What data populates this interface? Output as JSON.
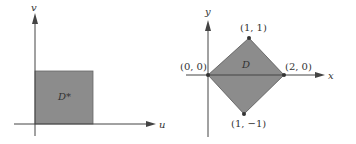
{
  "colors": {
    "background": "#ffffff",
    "axis": "#444444",
    "region_fill": "#8c8c8c",
    "region_stroke": "#555555",
    "text": "#333333",
    "vertex": "#333333"
  },
  "left_panel": {
    "x_axis_label": "u",
    "y_axis_label": "v",
    "region_label": "D*",
    "region_shape": "square"
  },
  "right_panel": {
    "x_axis_label": "x",
    "y_axis_label": "y",
    "region_label": "D",
    "region_shape": "diamond",
    "vertices": [
      {
        "label": "(0, 0)"
      },
      {
        "label": "(1, 1)"
      },
      {
        "label": "(2, 0)"
      },
      {
        "label": "(1, −1)"
      }
    ]
  }
}
